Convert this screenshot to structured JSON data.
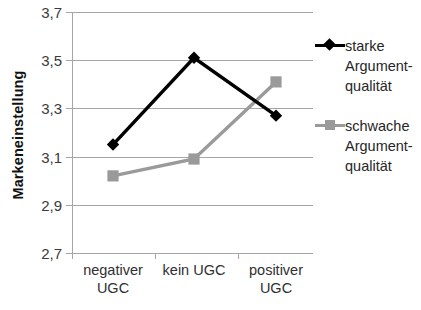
{
  "chart_data": {
    "type": "line",
    "title": "",
    "subtitle": "",
    "xlabel": "",
    "ylabel": "Markeneinstellung",
    "categories": [
      "negativer\nUGC",
      "kein UGC",
      "positiver\nUGC"
    ],
    "ylim": [
      2.7,
      3.7
    ],
    "ytick_labels": [
      "3,7",
      "3,5",
      "3,3",
      "3,1",
      "2,9",
      "2,7"
    ],
    "ytick_values": [
      3.7,
      3.5,
      3.3,
      3.1,
      2.9,
      2.7
    ],
    "grid": true,
    "legend_position": "right",
    "series": [
      {
        "name": "starke\nArgument-\nqualität",
        "values": [
          3.15,
          3.51,
          3.27
        ],
        "color": "#000000",
        "marker": "diamond"
      },
      {
        "name": "schwache\nArgument-\nqualität",
        "values": [
          3.02,
          3.09,
          3.41
        ],
        "color": "#9a9a9a",
        "marker": "square"
      }
    ]
  },
  "axes": {
    "y_title": "Markeneinstellung",
    "y_ticks": [
      {
        "label": "3,7"
      },
      {
        "label": "3,5"
      },
      {
        "label": "3,3"
      },
      {
        "label": "3,1"
      },
      {
        "label": "2,9"
      },
      {
        "label": "2,7"
      }
    ],
    "x_categories": [
      {
        "line1": "negativer",
        "line2": "UGC"
      },
      {
        "line1": "kein UGC",
        "line2": ""
      },
      {
        "line1": "positiver",
        "line2": "UGC"
      }
    ]
  },
  "legend": {
    "entries": [
      {
        "label": "starke\nArgument-\nqualität",
        "marker": "diamond-marker",
        "color": "#000000"
      },
      {
        "label": "schwache\nArgument-\nqualität",
        "marker": "square-marker",
        "color": "#9a9a9a"
      }
    ]
  },
  "colors": {
    "strong_series": "#000000",
    "weak_series": "#9a9a9a",
    "grid": "#a6a6a6",
    "text": "#262626"
  }
}
